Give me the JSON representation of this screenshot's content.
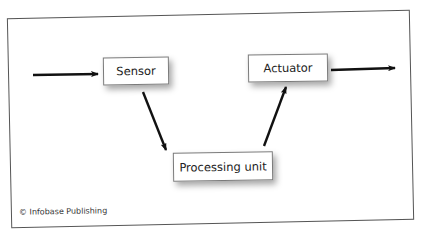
{
  "diagram": {
    "nodes": [
      {
        "id": "sensor",
        "label": "Sensor"
      },
      {
        "id": "processing",
        "label": "Processing unit"
      },
      {
        "id": "actuator",
        "label": "Actuator"
      }
    ],
    "edges": [
      {
        "from": "input",
        "to": "sensor"
      },
      {
        "from": "sensor",
        "to": "processing"
      },
      {
        "from": "processing",
        "to": "actuator"
      },
      {
        "from": "actuator",
        "to": "output"
      }
    ],
    "credit": "© Infobase Publishing",
    "colors": {
      "frame_border": "#555555",
      "box_border": "#7a7a7a",
      "arrow": "#111111",
      "text": "#222222"
    }
  }
}
